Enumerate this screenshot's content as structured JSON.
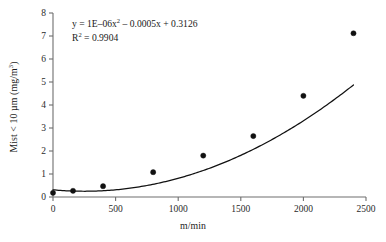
{
  "chart_data": {
    "type": "scatter",
    "title": "",
    "xlabel": "m/min",
    "ylabel_parts": {
      "prefix": "Mist < 10 ",
      "micro": "µ",
      "middle": "m (mg/m",
      "exponent": "3",
      "suffix": ")"
    },
    "ylabel": "Mist < 10 µm (mg/m³)",
    "xlim": [
      0,
      2500
    ],
    "ylim": [
      0,
      8
    ],
    "xticks": [
      0,
      500,
      1000,
      1500,
      2000,
      2500
    ],
    "yticks": [
      0,
      1,
      2,
      3,
      4,
      5,
      6,
      7,
      8
    ],
    "xtick_labels": [
      "0",
      "500",
      "1000",
      "1500",
      "2000",
      "2500"
    ],
    "ytick_labels": [
      "0",
      "1",
      "2",
      "3",
      "4",
      "5",
      "6",
      "7",
      "8"
    ],
    "grid": false,
    "legend": "none",
    "x": [
      0,
      160,
      400,
      800,
      1200,
      1600,
      2000,
      2400
    ],
    "y": [
      0.18,
      0.27,
      0.47,
      1.08,
      1.8,
      2.65,
      4.4,
      7.12
    ],
    "series": [
      {
        "name": "Mist < 10 µm",
        "points": [
          {
            "x": 0,
            "y": 0.18
          },
          {
            "x": 160,
            "y": 0.27
          },
          {
            "x": 400,
            "y": 0.47
          },
          {
            "x": 800,
            "y": 1.08
          },
          {
            "x": 1200,
            "y": 1.8
          },
          {
            "x": 1600,
            "y": 2.65
          },
          {
            "x": 2000,
            "y": 4.4
          },
          {
            "x": 2400,
            "y": 7.12
          }
        ]
      }
    ],
    "trendline": {
      "type": "polynomial",
      "order": 2,
      "a": 1e-06,
      "b": -0.0005,
      "c": 0.3126,
      "x_start": 0,
      "x_end": 2400
    },
    "annotations": {
      "equation_prefix": "y = 1E–06x",
      "equation_exponent": "2",
      "equation_suffix": " – 0.0005x + 0.3126",
      "equation": "y = 1E–06x² – 0.0005x + 0.3126",
      "r_squared_prefix": "R",
      "r_squared_exponent": "2",
      "r_squared_suffix": " = 0.9904",
      "r_squared": "R² = 0.9904"
    },
    "colors": {
      "marker": "#111111",
      "curve": "#111111",
      "axis": "#6e6e6e",
      "background": "#ffffff",
      "text": "#1a1a1a"
    }
  }
}
